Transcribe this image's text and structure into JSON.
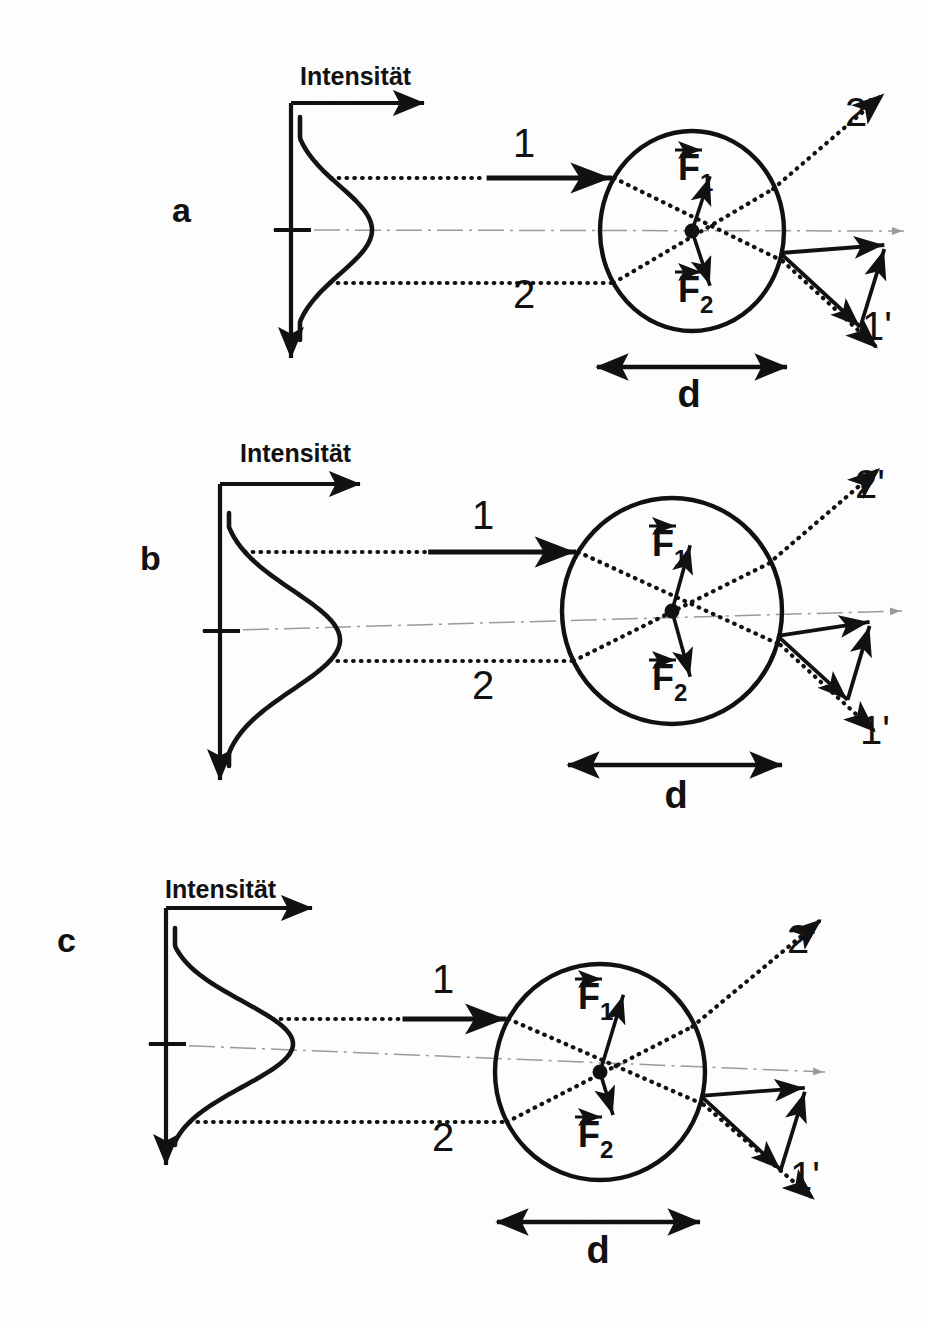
{
  "figure": {
    "title_semantic": "optical-trapping-gradient-force-diagram",
    "background_color": "#fefefe",
    "ink_color": "#111111",
    "axis_guide_color": "#9a9a9a",
    "panels": [
      {
        "id": "a",
        "label": "a",
        "label_x": 172,
        "label_y": 222,
        "axis_title": "Intensität",
        "axis_title_x": 300,
        "axis_title_y": 85,
        "axis_origin_x": 291,
        "axis_top_y": 103,
        "axis_bottom_y": 358,
        "axis_right_x": 424,
        "tick_y": 230,
        "peak_x": 372,
        "peak_y": 230,
        "curve_top_x": 300,
        "curve_top_y": 117,
        "curve_bottom_x": 302,
        "curve_bottom_y": 340,
        "sphere_cx": 692,
        "sphere_cy": 231,
        "sphere_rx": 92,
        "sphere_ry": 100,
        "ray1_y": 178,
        "ray2_y": 283,
        "ray1_label": "1",
        "ray1_label_x": 513,
        "ray1_label_y": 157,
        "ray2_label": "2",
        "ray2_label_x": 513,
        "ray2_label_y": 308,
        "ray1_out_label": "1'",
        "ray1_out_label_x": 862,
        "ray1_out_label_y": 340,
        "ray2_out_label": "2'",
        "ray2_out_label_x": 845,
        "ray2_out_label_y": 126,
        "force1_label": "F",
        "force1_sub": "1",
        "force1_label_x": 678,
        "force1_label_y": 180,
        "force2_label": "F",
        "force2_sub": "2",
        "force2_label_x": 678,
        "force2_label_y": 302,
        "force1_len": 62,
        "force2_len": 62,
        "force1_angle_deg": -62,
        "force2_angle_deg": 62,
        "dim_label": "d",
        "dim_y": 367,
        "dim_x1": 597,
        "dim_x2": 787,
        "dim_label_x": 689,
        "dim_label_y": 407,
        "intensity_peak_offset": 0,
        "net_force": "balanced",
        "description": "Sphere centered on beam axis, symmetric forces F1 and F2 cancel"
      },
      {
        "id": "b",
        "label": "b",
        "label_x": 140,
        "label_y": 570,
        "axis_title": "Intensität",
        "axis_title_x": 240,
        "axis_title_y": 462,
        "axis_origin_x": 220,
        "axis_top_y": 484,
        "axis_bottom_y": 780,
        "axis_right_x": 360,
        "tick_y": 631,
        "peak_x": 340,
        "peak_y": 640,
        "curve_top_x": 232,
        "curve_top_y": 513,
        "curve_bottom_x": 236,
        "curve_bottom_y": 766,
        "sphere_cx": 672,
        "sphere_cy": 611,
        "sphere_rx": 110,
        "sphere_ry": 113,
        "ray1_y": 552,
        "ray2_y": 661,
        "ray1_label": "1",
        "ray1_label_x": 472,
        "ray1_label_y": 529,
        "ray2_label": "2",
        "ray2_label_x": 472,
        "ray2_label_y": 699,
        "ray1_out_label": "1'",
        "ray1_out_label_x": 860,
        "ray1_out_label_y": 744,
        "ray2_out_label": "2'",
        "ray2_out_label_x": 855,
        "ray2_out_label_y": 498,
        "force1_label": "F",
        "force1_sub": "1",
        "force1_label_x": 652,
        "force1_label_y": 556,
        "force2_label": "F",
        "force2_sub": "2",
        "force2_label_x": 652,
        "force2_label_y": 690,
        "force1_len": 72,
        "force2_len": 72,
        "force1_angle_deg": -66,
        "force2_angle_deg": 66,
        "dim_label": "d",
        "dim_y": 765,
        "dim_x1": 568,
        "dim_x2": 782,
        "dim_label_x": 676,
        "dim_label_y": 808,
        "intensity_peak_offset": 9,
        "net_force": "upward",
        "description": "Larger sphere, beam peak slightly below axis, resultant restoring force"
      },
      {
        "id": "c",
        "label": "c",
        "label_x": 57,
        "label_y": 952,
        "axis_title": "Intensität",
        "axis_title_x": 165,
        "axis_title_y": 898,
        "axis_origin_x": 166,
        "axis_top_y": 908,
        "axis_bottom_y": 1165,
        "axis_right_x": 312,
        "tick_y": 1044,
        "peak_x": 293,
        "peak_y": 1044,
        "curve_top_x": 178,
        "curve_top_y": 928,
        "curve_bottom_x": 181,
        "curve_bottom_y": 1145,
        "sphere_cx": 600,
        "sphere_cy": 1072,
        "sphere_rx": 105,
        "sphere_ry": 108,
        "ray1_y": 1019,
        "ray2_y": 1122,
        "ray1_label": "1",
        "ray1_label_x": 432,
        "ray1_label_y": 993,
        "ray2_label": "2",
        "ray2_label_x": 432,
        "ray2_label_y": 1151,
        "ray1_out_label": "1'",
        "ray1_out_label_x": 790,
        "ray1_out_label_y": 1190,
        "ray2_out_label": "2'",
        "ray2_out_label_x": 787,
        "ray2_out_label_y": 953,
        "force1_label": "F",
        "force1_sub": "1",
        "force1_label_x": 578,
        "force1_label_y": 1009,
        "force2_label": "F",
        "force2_sub": "2",
        "force2_label_x": 578,
        "force2_label_y": 1147,
        "force1_len": 86,
        "force2_len": 48,
        "force1_angle_deg": -64,
        "force2_angle_deg": 64,
        "dim_label": "d",
        "dim_y": 1222,
        "dim_x1": 497,
        "dim_x2": 700,
        "dim_label_x": 598,
        "dim_label_y": 1263,
        "intensity_peak_offset": 0,
        "net_force": "upward-strong",
        "description": "Sphere below beam axis, F1 larger than F2 giving net upward gradient force"
      }
    ]
  },
  "chart_data": {
    "type": "line",
    "xlabel": "Intensität",
    "ylabel": "",
    "series": [
      {
        "name": "a",
        "profile": "gaussian",
        "peak_position": 0.0,
        "ray1_intensity": 0.62,
        "ray2_intensity": 0.62,
        "force1_magnitude": 1.0,
        "force2_magnitude": 1.0,
        "net_force": 0.0
      },
      {
        "name": "b",
        "profile": "gaussian",
        "peak_position": -0.06,
        "ray1_intensity": 0.7,
        "ray2_intensity": 0.55,
        "force1_magnitude": 1.0,
        "force2_magnitude": 1.0,
        "net_force": 0.15
      },
      {
        "name": "c",
        "profile": "gaussian",
        "peak_position": 0.0,
        "ray1_intensity": 0.85,
        "ray2_intensity": 0.4,
        "force1_magnitude": 1.8,
        "force2_magnitude": 1.0,
        "net_force": 0.45
      }
    ],
    "legend": [
      "1",
      "2",
      "1'",
      "2'"
    ],
    "annotations": [
      "Intensität",
      "F1",
      "F2",
      "d",
      "a",
      "b",
      "c"
    ],
    "grid": false
  }
}
